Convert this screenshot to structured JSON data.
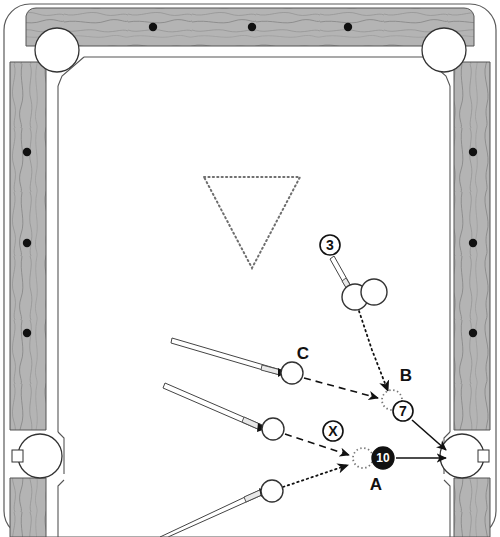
{
  "diagram": {
    "type": "billiards-shot-diagram",
    "surface_color": "#ffffff",
    "rail_color": "#b0b0b0",
    "line_color": "#1a1a1a",
    "ghost_color": "#808080"
  },
  "table": {
    "outer": {
      "x": 4,
      "y": 4,
      "width": 492,
      "height": 533
    },
    "rail_top": {
      "x": 36,
      "y": 8,
      "width": 428,
      "height": 38
    },
    "rail_left": {
      "x": 10,
      "y": 60,
      "width": 36,
      "height": 370
    },
    "rail_right": {
      "x": 454,
      "y": 60,
      "width": 36,
      "height": 370
    },
    "rail_left_lower": {
      "x": 10,
      "y": 470,
      "width": 36,
      "height": 67
    },
    "rail_right_lower": {
      "x": 454,
      "y": 470,
      "width": 36,
      "height": 67
    },
    "cloth": {
      "x": 48,
      "y": 48,
      "width": 404,
      "height": 489
    },
    "diamonds_top": [
      {
        "cx": 153,
        "cy": 27
      },
      {
        "cx": 252,
        "cy": 27
      },
      {
        "cx": 348,
        "cy": 27
      }
    ],
    "diamonds_left": [
      {
        "cx": 27,
        "cy": 152
      },
      {
        "cx": 27,
        "cy": 243
      },
      {
        "cx": 27,
        "cy": 333
      }
    ],
    "diamonds_right": [
      {
        "cx": 473,
        "cy": 152
      },
      {
        "cx": 473,
        "cy": 243
      },
      {
        "cx": 473,
        "cy": 333
      }
    ],
    "pockets": [
      {
        "name": "corner-top-left",
        "cx": 57,
        "cy": 50,
        "r": 22
      },
      {
        "name": "corner-top-right",
        "cx": 444,
        "cy": 50,
        "r": 22
      },
      {
        "name": "side-left",
        "cx": 40,
        "cy": 456,
        "r": 22
      },
      {
        "name": "side-right",
        "cx": 462,
        "cy": 456,
        "r": 22
      }
    ]
  },
  "rack": {
    "name": "rack-triangle",
    "points": "204,177 300,177 252,268",
    "style": "dotted"
  },
  "balls": [
    {
      "id": "cue-3",
      "label": "",
      "cx": 355,
      "cy": 297,
      "r": 13,
      "kind": "object"
    },
    {
      "id": "object-upper",
      "label": "",
      "cx": 374,
      "cy": 292,
      "r": 13,
      "kind": "object"
    },
    {
      "id": "cue-c",
      "label": "C",
      "cx": 292,
      "cy": 373,
      "r": 11,
      "kind": "cue"
    },
    {
      "id": "cue-x",
      "label": "",
      "cx": 273,
      "cy": 429,
      "r": 11,
      "kind": "cue"
    },
    {
      "id": "cue-lower",
      "label": "",
      "cx": 272,
      "cy": 491,
      "r": 11,
      "kind": "cue"
    }
  ],
  "ghost_balls": [
    {
      "id": "ghost-b",
      "label": "B",
      "cx": 392,
      "cy": 400,
      "r": 10,
      "label_x": 406,
      "label_y": 381
    },
    {
      "id": "ghost-a",
      "label": "A",
      "cx": 363,
      "cy": 458,
      "r": 10,
      "label_x": 376,
      "label_y": 487
    }
  ],
  "markers": [
    {
      "id": "marker-3",
      "text": "3",
      "cx": 330,
      "cy": 245,
      "r": 10,
      "style": "outline"
    },
    {
      "id": "marker-7",
      "text": "7",
      "cx": 403,
      "cy": 411,
      "r": 10,
      "style": "outline"
    },
    {
      "id": "marker-10",
      "text": "10",
      "cx": 383,
      "cy": 458,
      "r": 11,
      "style": "filled"
    },
    {
      "id": "marker-x",
      "text": "X",
      "cx": 333,
      "cy": 431,
      "r": 10,
      "style": "outline"
    }
  ],
  "labels": [
    {
      "id": "label-c",
      "text": "C",
      "x": 303,
      "y": 359
    },
    {
      "id": "label-b",
      "text": "B",
      "x": 406,
      "y": 381
    },
    {
      "id": "label-a",
      "text": "A",
      "x": 376,
      "y": 487
    }
  ],
  "cue_sticks": [
    {
      "id": "cue-stick-3",
      "x1": 336,
      "y1": 258,
      "x2": 355,
      "y2": 288,
      "angle": "down-right"
    },
    {
      "id": "cue-stick-c",
      "x1": 175,
      "y1": 338,
      "x2": 283,
      "y2": 371,
      "angle": "right"
    },
    {
      "id": "cue-stick-x",
      "x1": 168,
      "y1": 384,
      "x2": 263,
      "y2": 427,
      "angle": "right"
    },
    {
      "id": "cue-stick-lower",
      "x1": 163,
      "y1": 537,
      "x2": 263,
      "y2": 492,
      "angle": "up-right"
    }
  ],
  "paths": [
    {
      "id": "path-3-to-b",
      "style": "dotted",
      "from": "cue-3",
      "to": "ghost-b",
      "points": "359,311 373,350 390,392",
      "arrow": true
    },
    {
      "id": "path-c-to-b",
      "style": "dashed",
      "from": "cue-c",
      "to": "ghost-b",
      "points": "303,378 380,398",
      "arrow": true
    },
    {
      "id": "path-x-to-a",
      "style": "dashed",
      "from": "cue-x",
      "to": "ghost-a",
      "points": "284,434 351,455",
      "arrow": true
    },
    {
      "id": "path-lower-to-a",
      "style": "dotted",
      "from": "cue-lower",
      "to": "ghost-a",
      "points": "283,487 350,464",
      "arrow": true
    },
    {
      "id": "path-7-to-pocket",
      "style": "solid",
      "from": "marker-7",
      "to": "side-right",
      "points": "412,419 447,449",
      "arrow": true
    },
    {
      "id": "path-10-to-pocket",
      "style": "solid",
      "from": "marker-10",
      "to": "side-right",
      "points": "395,458 447,458",
      "arrow": true
    }
  ],
  "legend": {
    "solid_line": "object ball path to pocket",
    "dashed_line": "cue ball path",
    "dotted_line": "alternate cue ball path",
    "ghost_circle": "contact point / ghost ball"
  }
}
